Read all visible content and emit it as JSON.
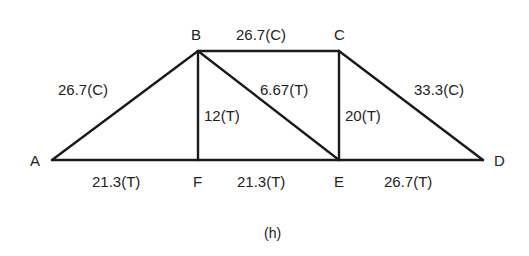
{
  "figure": {
    "caption": "(h)",
    "type": "truss force diagram"
  },
  "nodes": [
    {
      "id": "A",
      "label": "A",
      "x": 52,
      "y": 160
    },
    {
      "id": "B",
      "label": "B",
      "x": 198,
      "y": 51
    },
    {
      "id": "C",
      "label": "C",
      "x": 339,
      "y": 51
    },
    {
      "id": "D",
      "label": "D",
      "x": 483,
      "y": 160
    },
    {
      "id": "E",
      "label": "E",
      "x": 339,
      "y": 160
    },
    {
      "id": "F",
      "label": "F",
      "x": 198,
      "y": 160
    }
  ],
  "members": [
    {
      "id": "AB",
      "from": "A",
      "to": "B",
      "label": "26.7(C)"
    },
    {
      "id": "BC",
      "from": "B",
      "to": "C",
      "label": "26.7(C)"
    },
    {
      "id": "CD",
      "from": "C",
      "to": "D",
      "label": "33.3(C)"
    },
    {
      "id": "BF",
      "from": "B",
      "to": "F",
      "label": "12(T)"
    },
    {
      "id": "BE",
      "from": "B",
      "to": "E",
      "label": "6.67(T)"
    },
    {
      "id": "CE",
      "from": "C",
      "to": "E",
      "label": "20(T)"
    },
    {
      "id": "AF",
      "from": "A",
      "to": "F",
      "label": "21.3(T)"
    },
    {
      "id": "FE",
      "from": "F",
      "to": "E",
      "label": "21.3(T)"
    },
    {
      "id": "ED",
      "from": "E",
      "to": "D",
      "label": "26.7(T)"
    }
  ]
}
